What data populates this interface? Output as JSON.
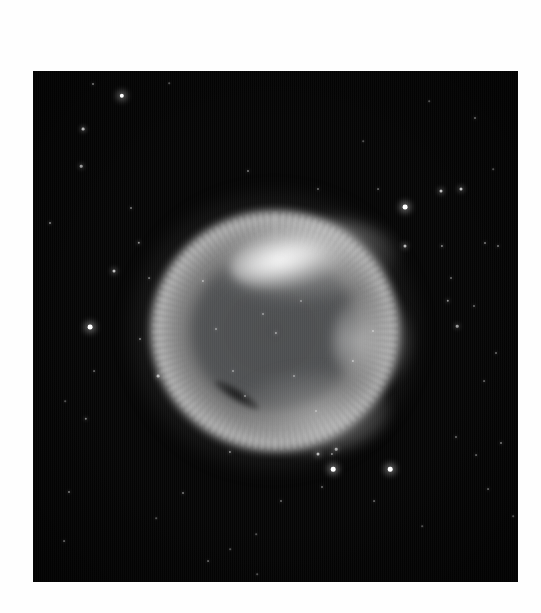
{
  "page": {
    "background_color": "#fefefe",
    "width": 541,
    "height": 613
  },
  "photo": {
    "subject": "helix-nebula",
    "description": "Grayscale astronomical photograph of a ring-shaped planetary nebula against a dark star field",
    "frame": {
      "x": 33,
      "y": 71,
      "width": 485,
      "height": 511
    },
    "background_color": "#050505",
    "nebula": {
      "center_x": 242,
      "center_y": 260,
      "outer_radius_x": 145,
      "outer_radius_y": 140,
      "ring_color": "#bababa",
      "cavity_color": "#4e5052",
      "brightest_knot_color": "#ffffff",
      "bright_regions": [
        "north-west-knot",
        "top-arc",
        "east-rim",
        "south-rim"
      ],
      "dark_lane": "lower-left-filament"
    },
    "stars": [
      {
        "x": 89,
        "y": 25,
        "r": 2.2,
        "b": 1.0
      },
      {
        "x": 60,
        "y": 13,
        "r": 1.0,
        "b": 0.45
      },
      {
        "x": 50,
        "y": 58,
        "r": 1.4,
        "b": 0.7
      },
      {
        "x": 48,
        "y": 95,
        "r": 1.3,
        "b": 0.6
      },
      {
        "x": 17,
        "y": 152,
        "r": 1.0,
        "b": 0.5
      },
      {
        "x": 98,
        "y": 137,
        "r": 1.0,
        "b": 0.45
      },
      {
        "x": 106,
        "y": 172,
        "r": 1.2,
        "b": 0.55
      },
      {
        "x": 81,
        "y": 200,
        "r": 1.5,
        "b": 0.75
      },
      {
        "x": 116,
        "y": 207,
        "r": 0.9,
        "b": 0.4
      },
      {
        "x": 57,
        "y": 256,
        "r": 2.4,
        "b": 1.0
      },
      {
        "x": 107,
        "y": 268,
        "r": 1.0,
        "b": 0.45
      },
      {
        "x": 61,
        "y": 300,
        "r": 0.9,
        "b": 0.35
      },
      {
        "x": 53,
        "y": 348,
        "r": 1.2,
        "b": 0.5
      },
      {
        "x": 32,
        "y": 330,
        "r": 0.8,
        "b": 0.3
      },
      {
        "x": 36,
        "y": 421,
        "r": 1.0,
        "b": 0.45
      },
      {
        "x": 31,
        "y": 470,
        "r": 0.9,
        "b": 0.35
      },
      {
        "x": 197,
        "y": 381,
        "r": 1.1,
        "b": 0.5
      },
      {
        "x": 150,
        "y": 422,
        "r": 1.0,
        "b": 0.45
      },
      {
        "x": 175,
        "y": 490,
        "r": 0.9,
        "b": 0.35
      },
      {
        "x": 224,
        "y": 503,
        "r": 0.8,
        "b": 0.3
      },
      {
        "x": 285,
        "y": 383,
        "r": 1.5,
        "b": 0.7
      },
      {
        "x": 303,
        "y": 378,
        "r": 1.3,
        "b": 0.6
      },
      {
        "x": 300,
        "y": 398,
        "r": 2.3,
        "b": 1.0
      },
      {
        "x": 299,
        "y": 383,
        "r": 1.1,
        "b": 0.5
      },
      {
        "x": 357,
        "y": 398,
        "r": 2.3,
        "b": 1.0
      },
      {
        "x": 289,
        "y": 416,
        "r": 1.0,
        "b": 0.4
      },
      {
        "x": 248,
        "y": 430,
        "r": 1.0,
        "b": 0.4
      },
      {
        "x": 341,
        "y": 430,
        "r": 0.9,
        "b": 0.35
      },
      {
        "x": 423,
        "y": 366,
        "r": 1.0,
        "b": 0.4
      },
      {
        "x": 468,
        "y": 372,
        "r": 1.0,
        "b": 0.45
      },
      {
        "x": 443,
        "y": 384,
        "r": 0.9,
        "b": 0.35
      },
      {
        "x": 455,
        "y": 418,
        "r": 0.9,
        "b": 0.35
      },
      {
        "x": 372,
        "y": 136,
        "r": 2.4,
        "b": 1.0
      },
      {
        "x": 408,
        "y": 120,
        "r": 1.5,
        "b": 0.75
      },
      {
        "x": 428,
        "y": 118,
        "r": 1.5,
        "b": 0.75
      },
      {
        "x": 345,
        "y": 118,
        "r": 0.9,
        "b": 0.35
      },
      {
        "x": 285,
        "y": 118,
        "r": 1.0,
        "b": 0.4
      },
      {
        "x": 452,
        "y": 172,
        "r": 1.0,
        "b": 0.45
      },
      {
        "x": 465,
        "y": 175,
        "r": 1.0,
        "b": 0.45
      },
      {
        "x": 409,
        "y": 175,
        "r": 1.1,
        "b": 0.5
      },
      {
        "x": 424,
        "y": 255,
        "r": 1.3,
        "b": 0.6
      },
      {
        "x": 441,
        "y": 235,
        "r": 1.0,
        "b": 0.4
      },
      {
        "x": 418,
        "y": 207,
        "r": 1.0,
        "b": 0.4
      },
      {
        "x": 372,
        "y": 175,
        "r": 1.5,
        "b": 0.72
      },
      {
        "x": 463,
        "y": 282,
        "r": 1.0,
        "b": 0.4
      },
      {
        "x": 451,
        "y": 310,
        "r": 0.9,
        "b": 0.35
      },
      {
        "x": 442,
        "y": 47,
        "r": 1.0,
        "b": 0.4
      },
      {
        "x": 415,
        "y": 230,
        "r": 1.2,
        "b": 0.55
      },
      {
        "x": 330,
        "y": 70,
        "r": 0.8,
        "b": 0.3
      },
      {
        "x": 125,
        "y": 305,
        "r": 1.4,
        "b": 0.65
      },
      {
        "x": 170,
        "y": 210,
        "r": 1.1,
        "b": 0.5
      },
      {
        "x": 215,
        "y": 100,
        "r": 1.0,
        "b": 0.45
      },
      {
        "x": 200,
        "y": 300,
        "r": 1.0,
        "b": 0.45
      },
      {
        "x": 230,
        "y": 243,
        "r": 1.0,
        "b": 0.45
      },
      {
        "x": 243,
        "y": 262,
        "r": 1.1,
        "b": 0.5
      },
      {
        "x": 261,
        "y": 305,
        "r": 1.0,
        "b": 0.45
      },
      {
        "x": 212,
        "y": 325,
        "r": 1.0,
        "b": 0.45
      },
      {
        "x": 268,
        "y": 230,
        "r": 1.0,
        "b": 0.4
      },
      {
        "x": 183,
        "y": 258,
        "r": 1.0,
        "b": 0.45
      },
      {
        "x": 283,
        "y": 340,
        "r": 1.0,
        "b": 0.4
      },
      {
        "x": 320,
        "y": 290,
        "r": 1.1,
        "b": 0.5
      },
      {
        "x": 340,
        "y": 260,
        "r": 1.0,
        "b": 0.45
      },
      {
        "x": 197,
        "y": 478,
        "r": 0.8,
        "b": 0.3
      },
      {
        "x": 123,
        "y": 447,
        "r": 0.8,
        "b": 0.3
      },
      {
        "x": 389,
        "y": 455,
        "r": 0.8,
        "b": 0.3
      },
      {
        "x": 480,
        "y": 445,
        "r": 0.8,
        "b": 0.3
      },
      {
        "x": 136,
        "y": 12,
        "r": 0.8,
        "b": 0.3
      },
      {
        "x": 396,
        "y": 30,
        "r": 0.8,
        "b": 0.3
      },
      {
        "x": 460,
        "y": 98,
        "r": 0.8,
        "b": 0.3
      },
      {
        "x": 223,
        "y": 463,
        "r": 0.8,
        "b": 0.3
      }
    ]
  }
}
